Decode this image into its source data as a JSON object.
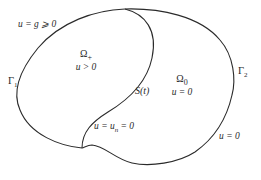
{
  "diagram": {
    "type": "free-boundary-domain",
    "curves": {
      "outer_boundary": "closed outer boundary (Γ1 on left, Γ2 on right)",
      "free_boundary": "S(t)"
    },
    "stroke_color": "#2a2a2a",
    "background": "#ffffff"
  },
  "labels": {
    "gamma1": "Γ",
    "gamma1_sub": "1",
    "gamma2": "Γ",
    "gamma2_sub": "2",
    "boundary_condition_left": "u = g ⩾ 0",
    "free_boundary": "S(t)",
    "free_boundary_condition": "u = u",
    "free_boundary_condition_sub": "n",
    "free_boundary_condition_tail": " = 0",
    "boundary_condition_right": "u = 0"
  },
  "regions": {
    "omega_plus": {
      "name": "Ω",
      "sub": "+",
      "condition": "u > 0"
    },
    "omega_zero": {
      "name": "Ω",
      "sub": "0",
      "condition": "u = 0"
    }
  }
}
